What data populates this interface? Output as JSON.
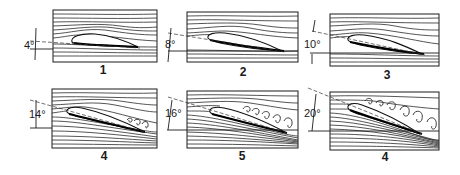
{
  "panels": [
    {
      "label": "1",
      "angle": "4°",
      "angle_deg": 4,
      "flow": "attached",
      "vortices": 0
    },
    {
      "label": "2",
      "angle": "8°",
      "angle_deg": 8,
      "flow": "attached",
      "vortices": 0
    },
    {
      "label": "3",
      "angle": "10°",
      "angle_deg": 10,
      "flow": "attached",
      "vortices": 0
    },
    {
      "label": "4",
      "angle": "14°",
      "angle_deg": 14,
      "flow": "trailing-edge separation onset",
      "vortices": 3
    },
    {
      "label": "5",
      "angle": "16°",
      "angle_deg": 16,
      "flow": "partial separation",
      "vortices": 5
    },
    {
      "label": "4",
      "angle": "20°",
      "angle_deg": 20,
      "flow": "full separation / stall",
      "vortices": 6
    }
  ],
  "colors": {
    "line": "#1a1a1a",
    "background": "#ffffff"
  }
}
